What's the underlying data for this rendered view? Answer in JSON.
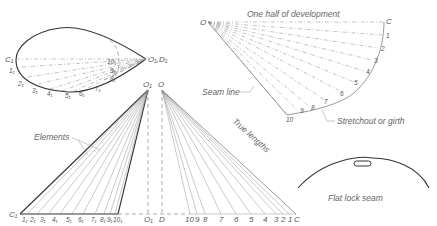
{
  "annotations": {
    "half_development": "One half of development",
    "seam_line": "Seam line",
    "stretchout": "Stretchout or girth",
    "elements": "Elements",
    "true_lengths": "True lengths",
    "flat_lock_seam": "Flat lock seam"
  },
  "plan_view": {
    "left_point": "C₁",
    "apex": "O₁,D₁",
    "labels": [
      "1₁",
      "2₁",
      "3₁",
      "4₁",
      "5₁",
      "6₁",
      "7₁",
      "8₁",
      "9₁",
      "10₁"
    ]
  },
  "development": {
    "apex": "O",
    "end": "C",
    "labels": [
      "1",
      "2",
      "3",
      "4",
      "5",
      "6",
      "7",
      "8",
      "9",
      "10"
    ]
  },
  "elevation": {
    "apex_left": "O₁",
    "apex_right": "O",
    "base_left_start": "C₁",
    "base_left_labels": [
      "1₁",
      "2₁",
      "3₁",
      "4₁",
      "5₁",
      "6₁",
      "7₁",
      "8₁",
      "9₁",
      "10₁"
    ],
    "center_left": "O₁",
    "center_right": "D",
    "true_length_labels": [
      "10",
      "9",
      "8",
      "7",
      "6",
      "5",
      "4",
      "3",
      "2",
      "1",
      "C"
    ]
  }
}
